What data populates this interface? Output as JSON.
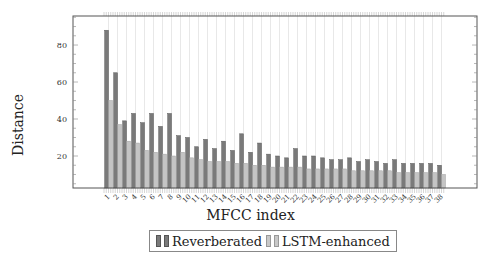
{
  "chart_data": {
    "type": "bar",
    "title": "",
    "xlabel": "MFCC index",
    "ylabel": "Distance",
    "ylim": [
      2.7,
      95.7
    ],
    "yticks": [
      20,
      40,
      60,
      80
    ],
    "grid": {
      "x": true,
      "y": false
    },
    "legend_position": "bottom-center",
    "categories": [
      "1",
      "2",
      "3",
      "4",
      "5",
      "6",
      "7",
      "8",
      "9",
      "10",
      "11",
      "12",
      "13",
      "14",
      "15",
      "16",
      "17",
      "18",
      "19",
      "20",
      "21",
      "22",
      "23",
      "24",
      "25",
      "26",
      "27",
      "28",
      "29",
      "30",
      "31",
      "32",
      "33",
      "34",
      "35",
      "36",
      "37",
      "38"
    ],
    "series": [
      {
        "name": "Reverberated",
        "color": "#7a7a7a",
        "values": [
          88,
          65,
          39,
          43,
          38,
          43,
          36,
          43,
          31,
          30,
          25,
          29,
          24,
          28,
          23,
          32,
          22,
          27,
          21,
          20,
          19,
          24,
          20,
          20,
          19,
          18,
          18,
          19,
          17,
          18,
          17,
          16,
          18,
          16,
          16,
          16,
          16,
          15
        ]
      },
      {
        "name": "LSTM-enhanced",
        "color": "#bdbdbd",
        "values": [
          50,
          37,
          28,
          27,
          23,
          22,
          21,
          20,
          22,
          19,
          18,
          17,
          17,
          17,
          16,
          16,
          15,
          15,
          14,
          14,
          14,
          14,
          13,
          13,
          13,
          13,
          13,
          12,
          12,
          12,
          12,
          12,
          11,
          11,
          11,
          11,
          11,
          10
        ]
      }
    ]
  },
  "labels": {
    "xlabel": "MFCC index",
    "ylabel": "Distance",
    "legend": [
      "Reverberated",
      "LSTM-enhanced"
    ]
  }
}
